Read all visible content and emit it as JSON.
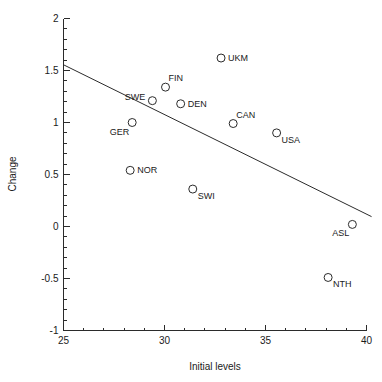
{
  "chart_data": {
    "type": "scatter",
    "title": "",
    "xlabel": "Initial levels",
    "ylabel": "Change",
    "xlim": [
      25,
      40
    ],
    "ylim": [
      -1,
      2
    ],
    "x_ticks": [
      25,
      30,
      35,
      40
    ],
    "x_tick_labels": [
      "25",
      "30",
      "35",
      "40"
    ],
    "x_minor_step": 1,
    "y_ticks": [
      -1,
      -0.5,
      0,
      0.5,
      1,
      1.5,
      2
    ],
    "y_tick_labels": [
      "-1",
      "-0.5",
      "0",
      "0.5",
      "1",
      "1.5",
      "2"
    ],
    "y_minor_step": 0.1,
    "grid": false,
    "legend": "none",
    "marker_style": "open-circle",
    "points": [
      {
        "label": "UKM",
        "x": 32.8,
        "y": 1.62,
        "label_pos": "right"
      },
      {
        "label": "FIN",
        "x": 30.05,
        "y": 1.34,
        "label_pos": "above-right"
      },
      {
        "label": "SWE",
        "x": 29.4,
        "y": 1.21,
        "label_pos": "left"
      },
      {
        "label": "DEN",
        "x": 30.8,
        "y": 1.18,
        "label_pos": "right"
      },
      {
        "label": "GER",
        "x": 28.4,
        "y": 1.0,
        "label_pos": "below-left"
      },
      {
        "label": "CAN",
        "x": 33.4,
        "y": 0.99,
        "label_pos": "above-right"
      },
      {
        "label": "USA",
        "x": 35.55,
        "y": 0.9,
        "label_pos": "below-right"
      },
      {
        "label": "NOR",
        "x": 28.3,
        "y": 0.54,
        "label_pos": "right"
      },
      {
        "label": "SWI",
        "x": 31.4,
        "y": 0.36,
        "label_pos": "below-right"
      },
      {
        "label": "ASL",
        "x": 39.3,
        "y": 0.02,
        "label_pos": "below-left"
      },
      {
        "label": "NTH",
        "x": 38.1,
        "y": -0.49,
        "label_pos": "below-right"
      }
    ],
    "fit_line": {
      "type": "linear-regression",
      "x_start": 25,
      "y_start": 1.555,
      "x_end": 40.25,
      "y_end": 0.095
    }
  },
  "colors": {
    "background": "#ffffff",
    "axis": "#2b2b2b",
    "marker": "#2b2b2b",
    "text": "#1a1a1a",
    "fit_line": "#2b2b2b"
  }
}
